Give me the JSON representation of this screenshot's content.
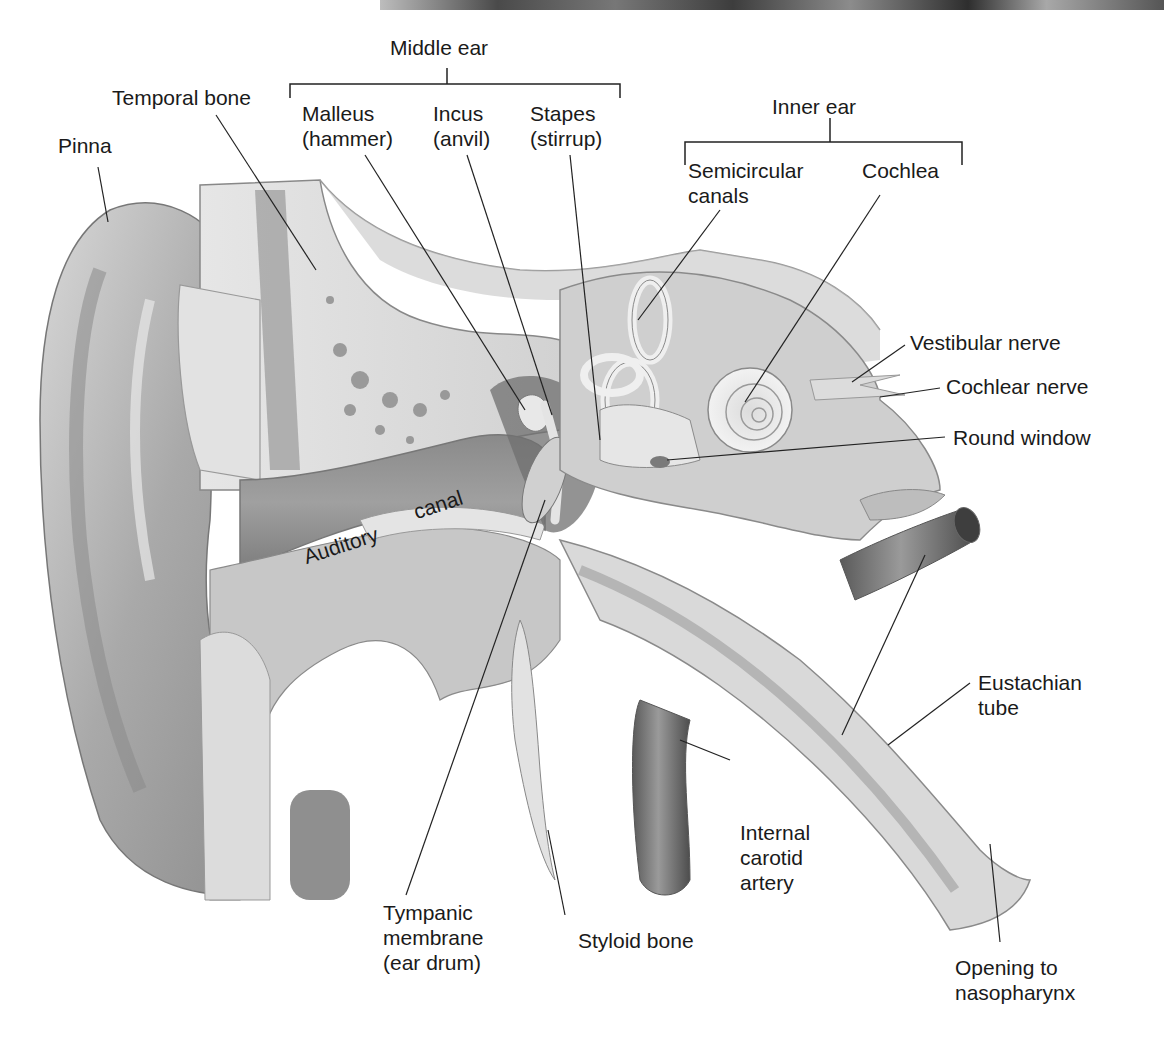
{
  "diagram": {
    "groups": [
      {
        "id": "middle-ear",
        "label": "Middle ear",
        "members": [
          "Malleus (hammer)",
          "Incus (anvil)",
          "Stapes (stirrup)"
        ]
      },
      {
        "id": "inner-ear",
        "label": "Inner ear",
        "members": [
          "Semicircular canals",
          "Cochlea"
        ]
      }
    ],
    "labels": {
      "middle_ear": "Middle ear",
      "inner_ear": "Inner ear",
      "temporal_bone": "Temporal bone",
      "pinna": "Pinna",
      "malleus": "Malleus\n(hammer)",
      "incus": "Incus\n(anvil)",
      "stapes": "Stapes\n(stirrup)",
      "semicircular_canals": "Semicircular\ncanals",
      "cochlea": "Cochlea",
      "vestibular_nerve": "Vestibular nerve",
      "cochlear_nerve": "Cochlear nerve",
      "round_window": "Round window",
      "auditory": "Auditory",
      "canal": "canal",
      "eustachian_tube": "Eustachian\ntube",
      "internal_carotid_artery": "Internal\ncarotid\nartery",
      "tympanic_membrane": "Tympanic\nmembrane\n(ear drum)",
      "styloid_bone": "Styloid bone",
      "opening_to_nasopharynx": "Opening to\nnasopharynx"
    }
  }
}
